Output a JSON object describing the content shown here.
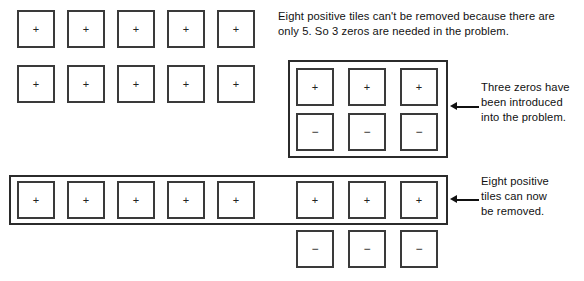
{
  "diagram": {
    "plus_symbol": "+",
    "minus_symbol": "−",
    "colors": {
      "tile_border": "#3a3a3a",
      "group_border": "#2b2b2b",
      "text": "#111111",
      "background": "#ffffff"
    }
  },
  "sections": {
    "top": {
      "name": "initial-five-positive-tiles",
      "rows": [
        {
          "name": "row-1",
          "tiles": [
            {
              "sign": "+"
            },
            {
              "sign": "+"
            },
            {
              "sign": "+"
            },
            {
              "sign": "+"
            },
            {
              "sign": "+"
            }
          ]
        },
        {
          "name": "row-2",
          "tiles": [
            {
              "sign": "+"
            },
            {
              "sign": "+"
            },
            {
              "sign": "+"
            },
            {
              "sign": "+"
            },
            {
              "sign": "+"
            }
          ]
        }
      ],
      "note": "Eight positive tiles can't be removed because there are only 5. So 3 zeros are needed in the problem."
    },
    "middle": {
      "name": "three-zero-pairs-introduced",
      "group_label": "zero-pairs-group",
      "plus_row": [
        {
          "sign": "+"
        },
        {
          "sign": "+"
        },
        {
          "sign": "+"
        }
      ],
      "minus_row": [
        {
          "sign": "−"
        },
        {
          "sign": "−"
        },
        {
          "sign": "−"
        }
      ],
      "note": "Three zeros have\nbeen introduced\ninto the problem."
    },
    "bottom": {
      "name": "eight-positive-tiles-grouped-for-removal",
      "group_label": "eight-positives-group",
      "grouped_tiles": [
        {
          "sign": "+"
        },
        {
          "sign": "+"
        },
        {
          "sign": "+"
        },
        {
          "sign": "+"
        },
        {
          "sign": "+"
        },
        {
          "sign": "+"
        },
        {
          "sign": "+"
        },
        {
          "sign": "+"
        }
      ],
      "remaining_minus_tiles": [
        {
          "sign": "−"
        },
        {
          "sign": "−"
        },
        {
          "sign": "−"
        }
      ],
      "note": "Eight positive\ntiles can now\nbe removed."
    }
  }
}
